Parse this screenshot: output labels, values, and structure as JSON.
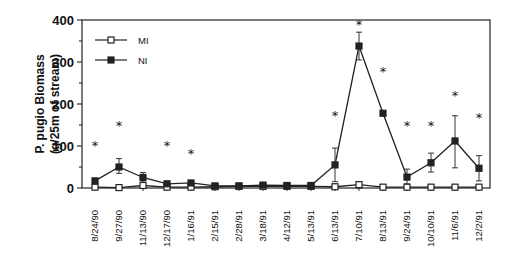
{
  "chart_data": {
    "type": "line",
    "title": "",
    "xlabel": "",
    "ylabel": "P. pugio Biomass",
    "ylabel2": "(g/25m of stream)",
    "ylim": [
      0,
      400
    ],
    "yticks": [
      0,
      100,
      200,
      300,
      400
    ],
    "yminor_step": 50,
    "grid": false,
    "legend_position": "upper-left",
    "categories": [
      "8/24/90",
      "9/27/90",
      "11/13/90",
      "12/17/90",
      "1/16/91",
      "2/15/91",
      "2/28/91",
      "3/18/91",
      "4/12/91",
      "5/13/91",
      "6/13/91",
      "7/10/91",
      "8/13/91",
      "9/24/91",
      "10/10/91",
      "11/6/91",
      "12/2/91"
    ],
    "series": [
      {
        "name": "MI",
        "marker": "open-square",
        "values": [
          2,
          1,
          6,
          2,
          2,
          3,
          4,
          4,
          4,
          4,
          3,
          8,
          2,
          2,
          2,
          2,
          2
        ],
        "err_low": [
          0,
          0,
          0,
          0,
          0,
          0,
          0,
          0,
          0,
          0,
          0,
          0,
          0,
          0,
          0,
          0,
          0
        ],
        "err_high": [
          4,
          2,
          12,
          4,
          4,
          5,
          6,
          6,
          6,
          6,
          8,
          12,
          3,
          3,
          3,
          3,
          3
        ]
      },
      {
        "name": "NI",
        "marker": "filled-square",
        "values": [
          17,
          50,
          25,
          10,
          12,
          5,
          5,
          7,
          6,
          6,
          55,
          338,
          178,
          26,
          60,
          112,
          47
        ],
        "err_low": [
          12,
          35,
          14,
          6,
          8,
          2,
          2,
          4,
          3,
          3,
          15,
          305,
          174,
          10,
          38,
          48,
          17
        ],
        "err_high": [
          22,
          70,
          37,
          14,
          16,
          8,
          8,
          10,
          9,
          9,
          95,
          371,
          182,
          45,
          83,
          172,
          77
        ]
      }
    ],
    "annotations": {
      "significance_marker": "*",
      "stars": [
        {
          "category": "8/24/90",
          "y": 102
        },
        {
          "category": "9/27/90",
          "y": 150
        },
        {
          "category": "12/17/90",
          "y": 102
        },
        {
          "category": "1/16/91",
          "y": 84
        },
        {
          "category": "6/13/91",
          "y": 174
        },
        {
          "category": "7/10/91",
          "y": 390
        },
        {
          "category": "8/13/91",
          "y": 278
        },
        {
          "category": "9/24/91",
          "y": 150
        },
        {
          "category": "10/10/91",
          "y": 150
        },
        {
          "category": "11/6/91",
          "y": 222
        },
        {
          "category": "12/2/91",
          "y": 170
        }
      ]
    },
    "legend": [
      {
        "label": "MI",
        "marker": "open-square"
      },
      {
        "label": "NI",
        "marker": "filled-square"
      }
    ]
  }
}
